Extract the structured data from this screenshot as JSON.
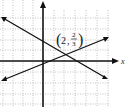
{
  "graph": {
    "x_axis_label": "x",
    "y_axis_label": "y",
    "intersection_label": {
      "x": "2",
      "num": "2",
      "den": "3"
    },
    "intersection_point": [
      2,
      0.6667
    ],
    "lines": [
      {
        "name": "decreasing-line",
        "slope": "negative"
      },
      {
        "name": "increasing-line",
        "slope": "positive"
      }
    ]
  }
}
